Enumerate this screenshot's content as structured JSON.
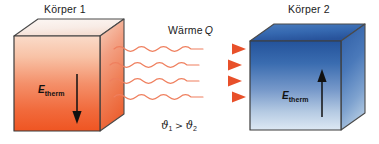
{
  "figure": {
    "background_color": "#ffffff",
    "width": 379,
    "height": 144
  },
  "body1": {
    "label": "Körper 1",
    "energy_symbol": "E",
    "energy_subscript": "therm",
    "energy_direction": "down",
    "color_front_top": "#f6cdb8",
    "color_front_bottom": "#f05a28",
    "color_side": "#f08a5d",
    "color_top": "#f7ece6",
    "outline_color": "#3b3b3b"
  },
  "body2": {
    "label": "Körper 2",
    "energy_symbol": "E",
    "energy_subscript": "therm",
    "energy_direction": "up",
    "color_front_top": "#2c5aa0",
    "color_front_bottom": "#dbe6f2",
    "color_side": "#3f6fb5",
    "color_top": "#3063ae",
    "outline_color": "#3b3b3b"
  },
  "heat_flow": {
    "label_text": "Wärme",
    "label_symbol": "Q",
    "arrow_count": 4,
    "arrow_color": "#e8502a",
    "wave_color": "#ef7f5e",
    "direction": "left-to-right"
  },
  "temperature_relation": {
    "theta": "ϑ",
    "left_subscript": "1",
    "operator": ">",
    "right_subscript": "2"
  }
}
